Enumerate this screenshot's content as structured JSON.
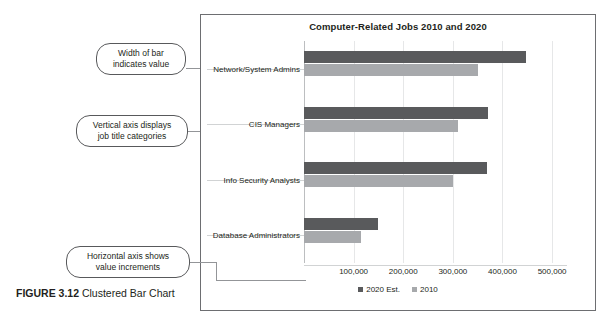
{
  "figure": {
    "caption_label": "FIGURE 3.12",
    "caption_text": " Clustered Bar Chart"
  },
  "callouts": [
    {
      "id": "width-of-bar",
      "line1": "Width of bar",
      "line2": "indicates value"
    },
    {
      "id": "vertical-axis",
      "line1": "Vertical axis displays",
      "line2": "job title categories"
    },
    {
      "id": "horizontal-axis",
      "line1": "Horizontal axis shows",
      "line2": "value increments"
    }
  ],
  "colors": {
    "series_2020": "#595a5c",
    "series_2010": "#a7a9ac",
    "panel_border": "#6d6e71",
    "gridline": "#e6e7e8",
    "callout_border": "#58595b",
    "text": "#231f20"
  },
  "chart_data": {
    "type": "bar",
    "orientation": "horizontal",
    "title": "Computer-Related Jobs 2010 and 2020",
    "xlabel": "",
    "ylabel": "",
    "categories": [
      "Network/System Admins",
      "CIS Managers",
      "Info Security Analysts",
      "Database Administrators"
    ],
    "series": [
      {
        "name": "2020 Est.",
        "color": "#595a5c",
        "values": [
          448000,
          370000,
          368000,
          150000
        ]
      },
      {
        "name": "2010",
        "color": "#a7a9ac",
        "values": [
          350000,
          310000,
          300000,
          115000
        ]
      }
    ],
    "xlim": [
      0,
      530000
    ],
    "xticks": [
      100000,
      200000,
      300000,
      400000,
      500000
    ],
    "xtick_labels": [
      "100,000",
      "200,000",
      "300,000",
      "400,000",
      "500,000"
    ],
    "gridlines": true,
    "legend_position": "bottom",
    "legend": [
      "2020 Est.",
      "2010"
    ]
  }
}
